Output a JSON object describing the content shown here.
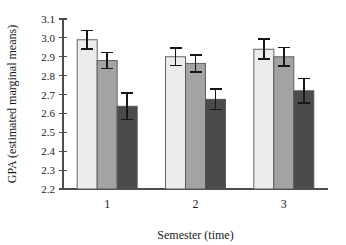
{
  "chart_data": {
    "type": "bar",
    "title": "",
    "subtitle": "",
    "xlabel": "Semester (time)",
    "ylabel": "GPA (estimated marginal means)",
    "categories": [
      "1",
      "2",
      "3"
    ],
    "ylim": [
      2.2,
      3.1
    ],
    "ytick_step": 0.1,
    "ytick_labels": [
      "2.2",
      "2.3",
      "2.4",
      "2.5",
      "2.6",
      "2.7",
      "2.8",
      "2.9",
      "3.0",
      "3.1"
    ],
    "ytick_values": [
      2.2,
      2.3,
      2.4,
      2.5,
      2.6,
      2.7,
      2.8,
      2.9,
      3.0,
      3.1
    ],
    "grid": false,
    "legend": "none",
    "error_bars": "standard error (symmetric)",
    "series": [
      {
        "name": "Group 1",
        "color": "#ececea",
        "values": [
          2.99,
          2.9,
          2.94
        ],
        "errors": [
          0.05,
          0.047,
          0.053
        ]
      },
      {
        "name": "Group 2",
        "color": "#a3a3a3",
        "values": [
          2.88,
          2.865,
          2.9
        ],
        "errors": [
          0.043,
          0.045,
          0.048
        ]
      },
      {
        "name": "Group 3",
        "color": "#4b4b4b",
        "values": [
          2.638,
          2.675,
          2.72
        ],
        "errors": [
          0.07,
          0.055,
          0.065
        ]
      }
    ]
  }
}
